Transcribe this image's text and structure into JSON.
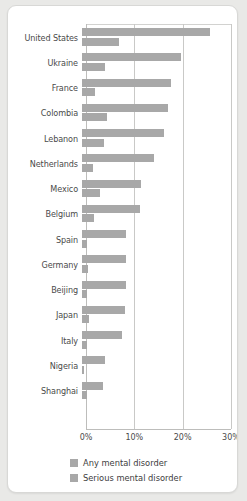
{
  "chart_data": {
    "type": "bar",
    "orientation": "horizontal",
    "title": "",
    "xlabel": "",
    "ylabel": "",
    "xlim": [
      0,
      30
    ],
    "grid": true,
    "gridlines": [
      0,
      10,
      20,
      30
    ],
    "tick_labels": [
      "0%",
      "10%",
      "20%",
      "30%"
    ],
    "legend_position": "bottom",
    "categories": [
      "United States",
      "Ukraine",
      "France",
      "Colombia",
      "Lebanon",
      "Netherlands",
      "Mexico",
      "Belgium",
      "Spain",
      "Germany",
      "Beijing",
      "Japan",
      "Italy",
      "Nigeria",
      "Shanghai"
    ],
    "series": [
      {
        "name": "Any mental disorder",
        "color": "#a8a8a8",
        "values": [
          26.4,
          20.5,
          18.4,
          17.8,
          16.9,
          14.9,
          12.2,
          12.0,
          9.2,
          9.1,
          9.1,
          8.8,
          8.2,
          4.7,
          4.3
        ]
      },
      {
        "name": "Serious mental disorder",
        "color": "#a8a8a8",
        "values": [
          7.7,
          4.8,
          2.7,
          5.2,
          4.6,
          2.3,
          3.7,
          2.4,
          1.0,
          1.2,
          1.1,
          1.5,
          1.0,
          0.4,
          1.1
        ]
      }
    ]
  },
  "legend": {
    "items": [
      {
        "label": "Any mental disorder",
        "color": "#a8a8a8"
      },
      {
        "label": "Serious mental disorder",
        "color": "#a8a8a8"
      }
    ]
  }
}
